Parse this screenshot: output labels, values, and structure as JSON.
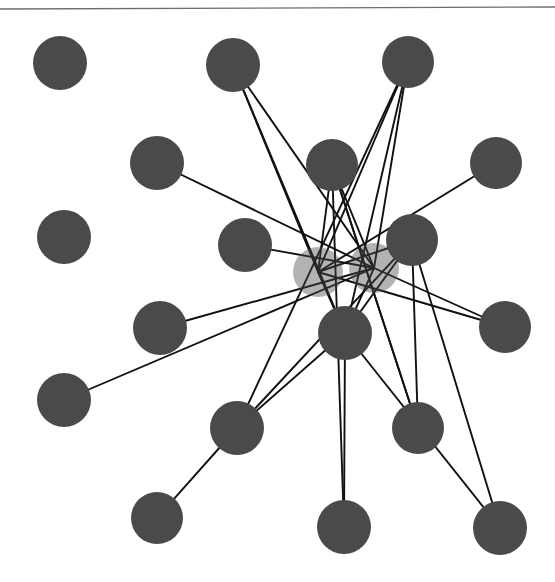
{
  "figure": {
    "width": 555,
    "height": 582,
    "background_color": "#ffffff"
  },
  "top_rule": {
    "name": "horizontal-rule",
    "x1": 0,
    "y1": 9,
    "x2": 555,
    "y2": 7,
    "color": "#6e6e6e",
    "stroke_width": 1.4
  },
  "style": {
    "node_fill": "#4a4a4a",
    "node_fill_faded": "#9a9a9a",
    "node_radius": 27,
    "edge_color": "#111111",
    "edge_width": 1.9
  },
  "chart_data": {
    "type": "scatter",
    "xlabel": "",
    "ylabel": "",
    "xlim": [
      0,
      555
    ],
    "ylim": [
      0,
      582
    ],
    "grid": false,
    "legend": "none",
    "node_count": 20,
    "edge_count": 30,
    "nodes": [
      {
        "id": "n0",
        "label": "node-0",
        "x": 60,
        "y": 63,
        "r": 27,
        "opacity": 1.0,
        "degree": 0
      },
      {
        "id": "n1",
        "label": "node-1",
        "x": 233,
        "y": 65,
        "r": 27,
        "opacity": 1.0,
        "degree": 3
      },
      {
        "id": "n2",
        "label": "node-2",
        "x": 408,
        "y": 62,
        "r": 26,
        "opacity": 1.0,
        "degree": 4
      },
      {
        "id": "n3",
        "label": "node-3",
        "x": 157,
        "y": 163,
        "r": 27,
        "opacity": 1.0,
        "degree": 1
      },
      {
        "id": "n4",
        "label": "node-4",
        "x": 332,
        "y": 165,
        "r": 26,
        "opacity": 1.0,
        "degree": 4
      },
      {
        "id": "n5",
        "label": "node-5",
        "x": 496,
        "y": 163,
        "r": 26,
        "opacity": 1.0,
        "degree": 1
      },
      {
        "id": "n6",
        "label": "node-6",
        "x": 64,
        "y": 237,
        "r": 27,
        "opacity": 1.0,
        "degree": 0
      },
      {
        "id": "n7",
        "label": "node-7",
        "x": 245,
        "y": 245,
        "r": 27,
        "opacity": 1.0,
        "degree": 1
      },
      {
        "id": "n8",
        "label": "node-8",
        "x": 412,
        "y": 240,
        "r": 26,
        "opacity": 1.0,
        "degree": 5
      },
      {
        "id": "n9",
        "label": "node-9",
        "x": 318,
        "y": 272,
        "r": 25,
        "opacity": 0.42,
        "degree": 6
      },
      {
        "id": "n10",
        "label": "node-10",
        "x": 374,
        "y": 268,
        "r": 25,
        "opacity": 0.42,
        "degree": 6
      },
      {
        "id": "n11",
        "label": "node-11",
        "x": 160,
        "y": 328,
        "r": 27,
        "opacity": 1.0,
        "degree": 1
      },
      {
        "id": "n12",
        "label": "node-12",
        "x": 345,
        "y": 333,
        "r": 27,
        "opacity": 1.0,
        "degree": 6
      },
      {
        "id": "n13",
        "label": "node-13",
        "x": 505,
        "y": 327,
        "r": 26,
        "opacity": 1.0,
        "degree": 2
      },
      {
        "id": "n14",
        "label": "node-14",
        "x": 64,
        "y": 400,
        "r": 27,
        "opacity": 1.0,
        "degree": 1
      },
      {
        "id": "n15",
        "label": "node-15",
        "x": 237,
        "y": 428,
        "r": 27,
        "opacity": 1.0,
        "degree": 4
      },
      {
        "id": "n16",
        "label": "node-16",
        "x": 418,
        "y": 428,
        "r": 26,
        "opacity": 1.0,
        "degree": 3
      },
      {
        "id": "n17",
        "label": "node-17",
        "x": 157,
        "y": 518,
        "r": 26,
        "opacity": 1.0,
        "degree": 1
      },
      {
        "id": "n18",
        "label": "node-18",
        "x": 344,
        "y": 527,
        "r": 27,
        "opacity": 1.0,
        "degree": 2
      },
      {
        "id": "n19",
        "label": "node-19",
        "x": 500,
        "y": 528,
        "r": 27,
        "opacity": 1.0,
        "degree": 2
      }
    ],
    "edges": [
      {
        "source": "n1",
        "target": "n9"
      },
      {
        "source": "n1",
        "target": "n10"
      },
      {
        "source": "n1",
        "target": "n12"
      },
      {
        "source": "n2",
        "target": "n9"
      },
      {
        "source": "n2",
        "target": "n10"
      },
      {
        "source": "n2",
        "target": "n12"
      },
      {
        "source": "n2",
        "target": "n15"
      },
      {
        "source": "n3",
        "target": "n10"
      },
      {
        "source": "n4",
        "target": "n9"
      },
      {
        "source": "n4",
        "target": "n10"
      },
      {
        "source": "n4",
        "target": "n16"
      },
      {
        "source": "n4",
        "target": "n18"
      },
      {
        "source": "n5",
        "target": "n9"
      },
      {
        "source": "n7",
        "target": "n10"
      },
      {
        "source": "n8",
        "target": "n9"
      },
      {
        "source": "n8",
        "target": "n15"
      },
      {
        "source": "n8",
        "target": "n12"
      },
      {
        "source": "n8",
        "target": "n16"
      },
      {
        "source": "n8",
        "target": "n19"
      },
      {
        "source": "n11",
        "target": "n10"
      },
      {
        "source": "n12",
        "target": "n9"
      },
      {
        "source": "n12",
        "target": "n10"
      },
      {
        "source": "n12",
        "target": "n15"
      },
      {
        "source": "n12",
        "target": "n18"
      },
      {
        "source": "n13",
        "target": "n9"
      },
      {
        "source": "n13",
        "target": "n10"
      },
      {
        "source": "n14",
        "target": "n10"
      },
      {
        "source": "n15",
        "target": "n17"
      },
      {
        "source": "n16",
        "target": "n4"
      },
      {
        "source": "n19",
        "target": "n12"
      }
    ]
  }
}
